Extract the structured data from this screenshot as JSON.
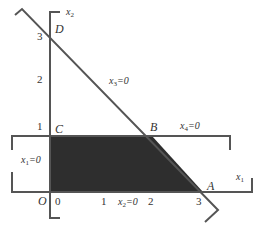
{
  "colors": {
    "line": "#555555",
    "fill": "#2e2e2e",
    "text": "#333333",
    "background": "#ffffff"
  },
  "axes": {
    "vertical": {
      "var": "x",
      "sub": "2"
    },
    "horizontal": {
      "var": "x",
      "sub": "1"
    }
  },
  "points": {
    "O": "O",
    "A": "A",
    "B": "B",
    "C": "C",
    "D": "D"
  },
  "ticks": {
    "y": [
      "1",
      "2",
      "3"
    ],
    "x": [
      "0",
      "1",
      "2",
      "3"
    ]
  },
  "constraints": {
    "x1_zero": {
      "var": "x",
      "sub": "1",
      "rhs": "=0"
    },
    "x2_zero": {
      "var": "x",
      "sub": "2",
      "rhs": "=0"
    },
    "x3_zero": {
      "var": "x",
      "sub": "3",
      "rhs": "=0"
    },
    "x4_zero": {
      "var": "x",
      "sub": "4",
      "rhs": "=0"
    }
  },
  "feasible_region": {
    "vertices": [
      "O",
      "C",
      "B",
      "A"
    ],
    "coords": [
      [
        0,
        0
      ],
      [
        0,
        1
      ],
      [
        2,
        1
      ],
      [
        3,
        0
      ]
    ]
  }
}
